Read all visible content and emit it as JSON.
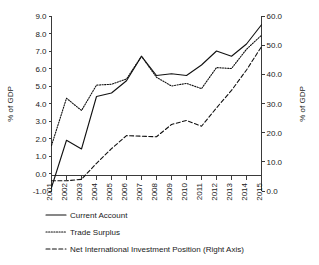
{
  "chart_data": {
    "type": "line",
    "title": "",
    "xlabel": "",
    "ylabel": "% of GDP",
    "ylabel_right": "% of GDP",
    "grid": false,
    "legend_position": "below",
    "categories": [
      "2001",
      "2002",
      "2003",
      "2004",
      "2005",
      "2006",
      "2007",
      "2008",
      "2009",
      "2010",
      "2011",
      "2012",
      "2013",
      "2014",
      "2015"
    ],
    "ylim": [
      -1.0,
      9.0
    ],
    "ylim_right": [
      0.0,
      60.0
    ],
    "yticks": [
      "9.0",
      "8.0",
      "7.0",
      "6.0",
      "5.0",
      "4.0",
      "3.0",
      "2.0",
      "1.0",
      "0.0",
      "-1.0"
    ],
    "yticks_right": [
      "60.0",
      "50.0",
      "40.0",
      "30.0",
      "20.0",
      "10.0",
      "0.0"
    ],
    "series": [
      {
        "name": "Current Account",
        "axis": "left",
        "style": "solid",
        "values": [
          -0.8,
          1.9,
          1.4,
          4.4,
          4.6,
          5.3,
          6.7,
          5.6,
          5.7,
          5.6,
          6.2,
          7.0,
          6.7,
          7.4,
          8.5
        ]
      },
      {
        "name": "Trade Surplus",
        "axis": "left",
        "style": "dotted",
        "values": [
          1.6,
          4.3,
          3.6,
          5.05,
          5.1,
          5.4,
          6.7,
          5.5,
          5.0,
          5.15,
          4.85,
          6.05,
          6.0,
          7.1,
          7.9
        ]
      },
      {
        "name": "Net International Investment Position (Right Axis)",
        "axis": "right",
        "style": "dashed",
        "values": [
          3.5,
          3.5,
          4.0,
          9.5,
          14.5,
          19.0,
          18.8,
          18.6,
          22.8,
          24.2,
          22.2,
          28.5,
          34.5,
          41.5,
          49.5
        ]
      }
    ],
    "legend": [
      {
        "label": "Current Account",
        "style": "solid"
      },
      {
        "label": "Trade Surplus",
        "style": "dotted"
      },
      {
        "label": "Net International Investment Position (Right Axis)",
        "style": "dashed"
      }
    ]
  }
}
